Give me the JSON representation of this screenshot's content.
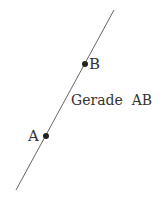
{
  "diagram": {
    "line": {
      "x1": 114,
      "y1": 10,
      "x2": 16,
      "y2": 190,
      "color": "#555555"
    },
    "points": [
      {
        "name": "B",
        "x": 85,
        "y": 64,
        "label_x": 89,
        "label_y": 69
      },
      {
        "name": "A",
        "x": 46,
        "y": 136,
        "label_x": 28,
        "label_y": 141
      }
    ],
    "line_label": {
      "text": "Gerade  AB",
      "x": 71,
      "y": 105
    },
    "point_color": "#222222"
  }
}
